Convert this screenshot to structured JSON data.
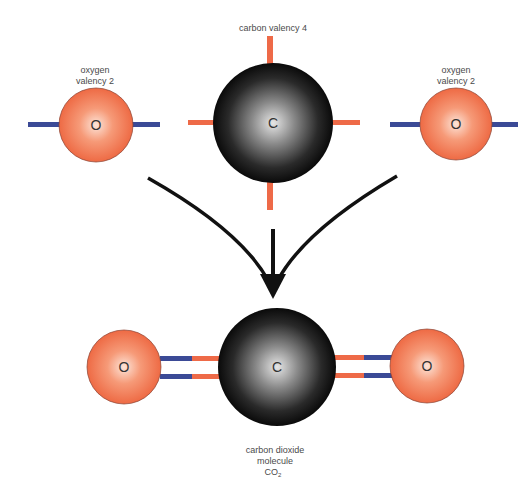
{
  "colors": {
    "oxygen": "#f0704a",
    "oxygen_highlight": "#fde4d8",
    "carbon": "#111111",
    "carbon_highlight": "#e8e8e8",
    "bond_oxygen": "#3b4a96",
    "bond_carbon": "#ee6a48",
    "arrow": "#111111"
  },
  "top": {
    "oxygen_left": {
      "label_line1": "oxygen",
      "label_line2": "valency 2",
      "symbol": "O"
    },
    "carbon": {
      "label": "carbon valency 4",
      "symbol": "C"
    },
    "oxygen_right": {
      "label_line1": "oxygen",
      "label_line2": "valency 2",
      "symbol": "O"
    }
  },
  "bottom": {
    "oxygen_left": {
      "symbol": "O"
    },
    "carbon": {
      "symbol": "C"
    },
    "oxygen_right": {
      "symbol": "O"
    },
    "caption_line1": "carbon dioxide",
    "caption_line2": "molecule",
    "caption_formula": "CO",
    "caption_subscript": "2"
  }
}
